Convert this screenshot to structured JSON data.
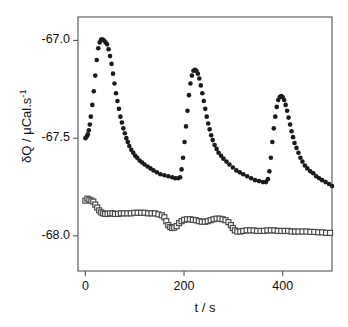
{
  "figure": {
    "background": "#ffffff",
    "frame_color": "#555555",
    "plot_box_px": {
      "left": 78,
      "right": 332,
      "top": 17,
      "bottom": 271
    }
  },
  "axes": {
    "x": {
      "label_html": "t / s",
      "label_plain": "t / s",
      "ticks": [
        0,
        200,
        400
      ],
      "tick_labels": [
        "0",
        "200",
        "400"
      ],
      "range": [
        -15,
        500
      ]
    },
    "y": {
      "label_plain": "δQ / μCal.s⁻¹",
      "label_symbol": "δQ",
      "label_units": "μCal.s",
      "label_units_exponent": "-1",
      "ticks": [
        -67.0,
        -67.5,
        -68.0
      ],
      "tick_labels": [
        "-67.0",
        "-67.5",
        "-68.0"
      ],
      "range": [
        -68.18,
        -66.88
      ]
    }
  },
  "chart_data": {
    "type": "scatter",
    "title": "",
    "xlabel": "t / s",
    "ylabel": "δQ / μCal.s⁻¹",
    "xlim": [
      -15,
      500
    ],
    "ylim": [
      -68.18,
      -66.88
    ],
    "grid": false,
    "legend": "none",
    "series": [
      {
        "name": "upper-trace-filled-circles",
        "marker": "filled-circle",
        "color": "#1a1a1a",
        "marker_size_px": 4.6,
        "description": "Three exponential-decay injection peaks of decreasing height on a slowly drifting baseline",
        "points": [
          [
            0,
            -67.5
          ],
          [
            3,
            -67.49
          ],
          [
            5,
            -67.48
          ],
          [
            7,
            -67.46
          ],
          [
            9,
            -67.43
          ],
          [
            11,
            -67.39
          ],
          [
            14,
            -67.33
          ],
          [
            17,
            -67.26
          ],
          [
            20,
            -67.18
          ],
          [
            23,
            -67.1
          ],
          [
            26,
            -67.04
          ],
          [
            29,
            -67.01
          ],
          [
            32,
            -66.995
          ],
          [
            35,
            -66.995
          ],
          [
            38,
            -67.0
          ],
          [
            41,
            -67.01
          ],
          [
            44,
            -67.02
          ],
          [
            47,
            -67.045
          ],
          [
            50,
            -67.08
          ],
          [
            53,
            -67.12
          ],
          [
            56,
            -67.17
          ],
          [
            59,
            -67.22
          ],
          [
            62,
            -67.27
          ],
          [
            65,
            -67.31
          ],
          [
            68,
            -67.35
          ],
          [
            71,
            -67.39
          ],
          [
            74,
            -67.42
          ],
          [
            77,
            -67.45
          ],
          [
            80,
            -67.475
          ],
          [
            83,
            -67.5
          ],
          [
            86,
            -67.52
          ],
          [
            89,
            -67.54
          ],
          [
            93,
            -67.56
          ],
          [
            97,
            -67.575
          ],
          [
            101,
            -67.59
          ],
          [
            105,
            -67.6
          ],
          [
            110,
            -67.615
          ],
          [
            115,
            -67.625
          ],
          [
            120,
            -67.635
          ],
          [
            126,
            -67.645
          ],
          [
            132,
            -67.655
          ],
          [
            138,
            -67.665
          ],
          [
            145,
            -67.675
          ],
          [
            152,
            -67.685
          ],
          [
            160,
            -67.69
          ],
          [
            168,
            -67.695
          ],
          [
            176,
            -67.7
          ],
          [
            182,
            -67.705
          ],
          [
            188,
            -67.705
          ],
          [
            192,
            -67.7
          ],
          [
            195,
            -67.66
          ],
          [
            198,
            -67.6
          ],
          [
            201,
            -67.52
          ],
          [
            204,
            -67.44
          ],
          [
            207,
            -67.36
          ],
          [
            210,
            -67.28
          ],
          [
            213,
            -67.22
          ],
          [
            216,
            -67.18
          ],
          [
            219,
            -67.155
          ],
          [
            222,
            -67.15
          ],
          [
            225,
            -67.155
          ],
          [
            228,
            -67.17
          ],
          [
            231,
            -67.195
          ],
          [
            234,
            -67.23
          ],
          [
            237,
            -67.27
          ],
          [
            240,
            -67.31
          ],
          [
            243,
            -67.35
          ],
          [
            246,
            -67.39
          ],
          [
            249,
            -67.425
          ],
          [
            252,
            -67.455
          ],
          [
            255,
            -67.485
          ],
          [
            258,
            -67.51
          ],
          [
            262,
            -67.535
          ],
          [
            266,
            -67.555
          ],
          [
            270,
            -67.575
          ],
          [
            275,
            -67.59
          ],
          [
            280,
            -67.605
          ],
          [
            286,
            -67.62
          ],
          [
            292,
            -67.635
          ],
          [
            299,
            -67.65
          ],
          [
            306,
            -67.665
          ],
          [
            313,
            -67.675
          ],
          [
            320,
            -67.685
          ],
          [
            328,
            -67.695
          ],
          [
            336,
            -67.705
          ],
          [
            344,
            -67.715
          ],
          [
            352,
            -67.72
          ],
          [
            360,
            -67.725
          ],
          [
            366,
            -67.725
          ],
          [
            370,
            -67.71
          ],
          [
            373,
            -67.67
          ],
          [
            376,
            -67.6
          ],
          [
            379,
            -67.52
          ],
          [
            382,
            -67.45
          ],
          [
            385,
            -67.39
          ],
          [
            388,
            -67.34
          ],
          [
            391,
            -67.305
          ],
          [
            394,
            -67.29
          ],
          [
            397,
            -67.285
          ],
          [
            400,
            -67.29
          ],
          [
            403,
            -67.305
          ],
          [
            406,
            -67.33
          ],
          [
            409,
            -67.36
          ],
          [
            412,
            -67.395
          ],
          [
            415,
            -67.43
          ],
          [
            418,
            -67.465
          ],
          [
            421,
            -67.495
          ],
          [
            424,
            -67.525
          ],
          [
            428,
            -67.55
          ],
          [
            432,
            -67.575
          ],
          [
            436,
            -67.6
          ],
          [
            440,
            -67.62
          ],
          [
            445,
            -67.64
          ],
          [
            450,
            -67.655
          ],
          [
            456,
            -67.67
          ],
          [
            462,
            -67.68
          ],
          [
            468,
            -67.695
          ],
          [
            474,
            -67.705
          ],
          [
            480,
            -67.715
          ],
          [
            487,
            -67.725
          ],
          [
            494,
            -67.735
          ],
          [
            500,
            -67.745
          ]
        ]
      },
      {
        "name": "lower-trace-open-squares",
        "marker": "open-square",
        "color": "#4a4a4a",
        "marker_size_px": 5.0,
        "description": "Stepwise descending baseline trace with small plateaus",
        "points": [
          [
            0,
            -67.82
          ],
          [
            4,
            -67.81
          ],
          [
            8,
            -67.815
          ],
          [
            12,
            -67.82
          ],
          [
            16,
            -67.825
          ],
          [
            20,
            -67.84
          ],
          [
            24,
            -67.855
          ],
          [
            28,
            -67.87
          ],
          [
            32,
            -67.88
          ],
          [
            36,
            -67.885
          ],
          [
            40,
            -67.888
          ],
          [
            45,
            -67.888
          ],
          [
            50,
            -67.885
          ],
          [
            55,
            -67.885
          ],
          [
            60,
            -67.888
          ],
          [
            66,
            -67.888
          ],
          [
            72,
            -67.885
          ],
          [
            78,
            -67.885
          ],
          [
            85,
            -67.885
          ],
          [
            92,
            -67.885
          ],
          [
            99,
            -67.882
          ],
          [
            106,
            -67.882
          ],
          [
            113,
            -67.882
          ],
          [
            120,
            -67.882
          ],
          [
            127,
            -67.885
          ],
          [
            134,
            -67.885
          ],
          [
            141,
            -67.885
          ],
          [
            148,
            -67.89
          ],
          [
            155,
            -67.895
          ],
          [
            160,
            -67.905
          ],
          [
            164,
            -67.925
          ],
          [
            168,
            -67.945
          ],
          [
            172,
            -67.955
          ],
          [
            176,
            -67.96
          ],
          [
            180,
            -67.958
          ],
          [
            185,
            -67.95
          ],
          [
            190,
            -67.935
          ],
          [
            195,
            -67.925
          ],
          [
            200,
            -67.918
          ],
          [
            206,
            -67.915
          ],
          [
            212,
            -67.915
          ],
          [
            218,
            -67.918
          ],
          [
            224,
            -67.92
          ],
          [
            230,
            -67.925
          ],
          [
            236,
            -67.928
          ],
          [
            242,
            -67.928
          ],
          [
            248,
            -67.925
          ],
          [
            254,
            -67.92
          ],
          [
            260,
            -67.915
          ],
          [
            266,
            -67.912
          ],
          [
            272,
            -67.912
          ],
          [
            278,
            -67.915
          ],
          [
            284,
            -67.92
          ],
          [
            290,
            -67.93
          ],
          [
            295,
            -67.945
          ],
          [
            299,
            -67.96
          ],
          [
            303,
            -67.972
          ],
          [
            308,
            -67.978
          ],
          [
            314,
            -67.978
          ],
          [
            320,
            -67.975
          ],
          [
            327,
            -67.972
          ],
          [
            334,
            -67.972
          ],
          [
            341,
            -67.972
          ],
          [
            348,
            -67.975
          ],
          [
            355,
            -67.975
          ],
          [
            362,
            -67.975
          ],
          [
            369,
            -67.972
          ],
          [
            376,
            -67.972
          ],
          [
            383,
            -67.972
          ],
          [
            390,
            -67.975
          ],
          [
            397,
            -67.975
          ],
          [
            404,
            -67.975
          ],
          [
            411,
            -67.975
          ],
          [
            418,
            -67.978
          ],
          [
            425,
            -67.978
          ],
          [
            432,
            -67.978
          ],
          [
            440,
            -67.978
          ],
          [
            448,
            -67.978
          ],
          [
            456,
            -67.98
          ],
          [
            464,
            -67.98
          ],
          [
            472,
            -67.982
          ],
          [
            480,
            -67.982
          ],
          [
            488,
            -67.985
          ],
          [
            496,
            -67.985
          ]
        ]
      }
    ]
  }
}
